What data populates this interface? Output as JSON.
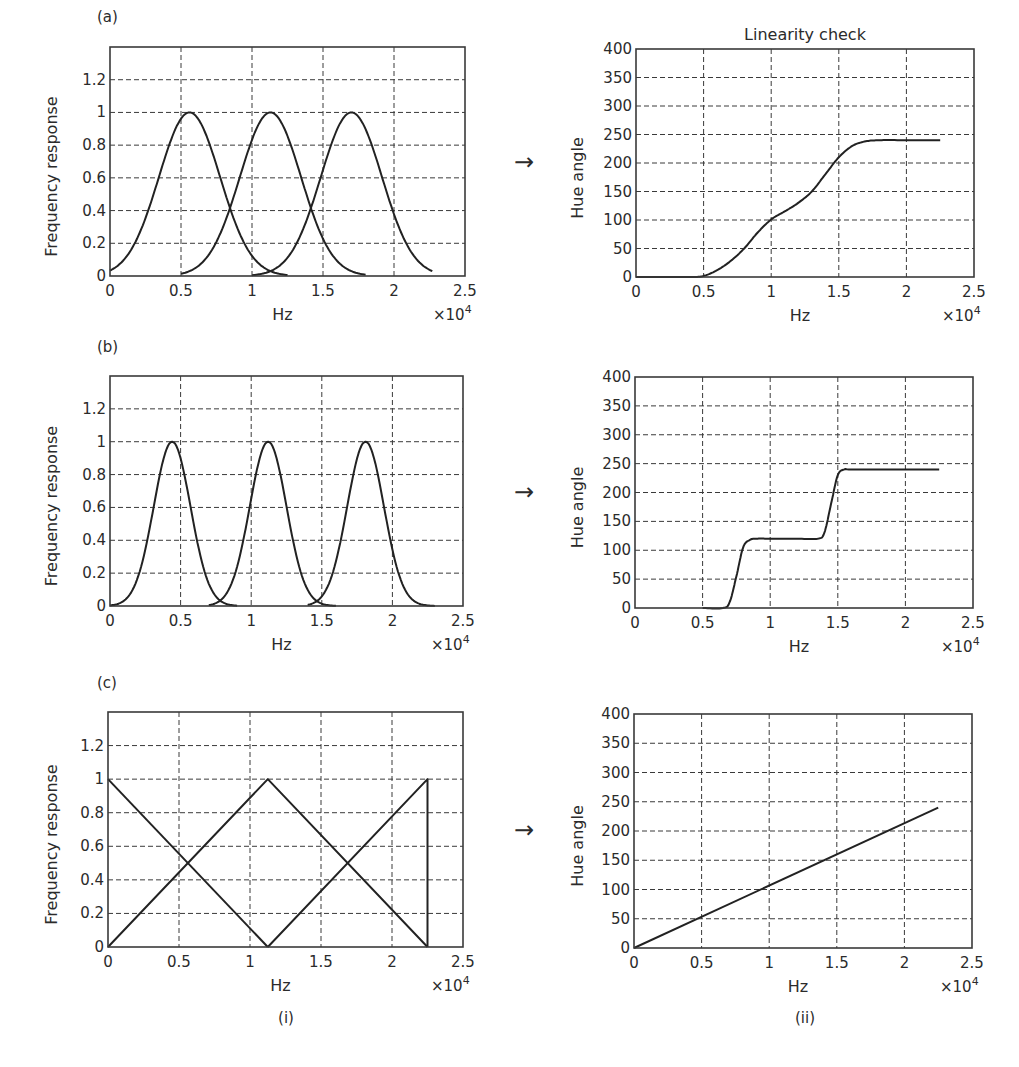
{
  "figure": {
    "panel_labels": [
      "(a)",
      "(b)",
      "(c)"
    ],
    "column_labels": [
      "(i)",
      "(ii)"
    ],
    "arrow_glyph": "→",
    "right_title": "Linearity check",
    "x_label": "Hz",
    "x_multiplier": "×10",
    "x_multiplier_exp": "4"
  },
  "chart_data": [
    {
      "id": "a-i",
      "type": "line",
      "title": "",
      "xlabel": "Hz",
      "xlabel_multiplier": "×10^4",
      "ylabel": "Frequency response",
      "xlim": [
        0,
        2.5
      ],
      "ylim": [
        0,
        1.4
      ],
      "xticks": [
        "0",
        "0.5",
        "1",
        "1.5",
        "2",
        "2.5"
      ],
      "yticks": [
        "0",
        "0.2",
        "0.4",
        "0.6",
        "0.8",
        "1",
        "1.2"
      ],
      "grid": true,
      "series": [
        {
          "name": "filter 1",
          "shape": "gaussian",
          "center": 0.56,
          "peak": 1,
          "x": [
            0,
            0.1,
            0.2,
            0.3,
            0.4,
            0.5,
            0.56,
            0.65,
            0.75,
            0.85,
            0.95,
            1.05,
            1.15,
            1.25
          ],
          "values": [
            0.04,
            0.13,
            0.29,
            0.52,
            0.77,
            0.96,
            1.0,
            0.93,
            0.72,
            0.45,
            0.22,
            0.08,
            0.02,
            0.0
          ]
        },
        {
          "name": "filter 2",
          "shape": "gaussian",
          "center": 1.13,
          "peak": 1,
          "x": [
            0.5,
            0.6,
            0.7,
            0.8,
            0.9,
            1.0,
            1.13,
            1.25,
            1.35,
            1.45,
            1.55,
            1.65,
            1.75,
            1.8
          ],
          "values": [
            0.0,
            0.03,
            0.11,
            0.28,
            0.55,
            0.83,
            1.0,
            0.88,
            0.65,
            0.39,
            0.18,
            0.06,
            0.01,
            0.0
          ]
        },
        {
          "name": "filter 3",
          "shape": "gaussian",
          "center": 1.7,
          "peak": 1,
          "x": [
            1.0,
            1.1,
            1.2,
            1.3,
            1.4,
            1.5,
            1.6,
            1.7,
            1.8,
            1.9,
            2.0,
            2.1,
            2.2,
            2.27
          ],
          "values": [
            0.0,
            0.01,
            0.06,
            0.18,
            0.39,
            0.65,
            0.9,
            1.0,
            0.91,
            0.68,
            0.41,
            0.2,
            0.08,
            0.05
          ]
        }
      ]
    },
    {
      "id": "a-ii",
      "type": "line",
      "title": "Linearity check",
      "xlabel": "Hz",
      "xlabel_multiplier": "×10^4",
      "ylabel": "Hue angle",
      "xlim": [
        0,
        2.5
      ],
      "ylim": [
        0,
        400
      ],
      "xticks": [
        "0",
        "0.5",
        "1",
        "1.5",
        "2",
        "2.5"
      ],
      "yticks": [
        "0",
        "50",
        "100",
        "150",
        "200",
        "250",
        "300",
        "350",
        "400"
      ],
      "grid": true,
      "series": [
        {
          "name": "hue",
          "x": [
            0,
            0.4,
            0.5,
            0.6,
            0.7,
            0.8,
            0.9,
            1.0,
            1.1,
            1.2,
            1.3,
            1.4,
            1.5,
            1.6,
            1.7,
            1.8,
            2.0,
            2.25
          ],
          "values": [
            0,
            0,
            2,
            12,
            28,
            50,
            78,
            101,
            115,
            130,
            150,
            180,
            210,
            230,
            238,
            240,
            240,
            240
          ]
        }
      ]
    },
    {
      "id": "b-i",
      "type": "line",
      "title": "",
      "xlabel": "Hz",
      "xlabel_multiplier": "×10^4",
      "ylabel": "Frequency response",
      "xlim": [
        0,
        2.5
      ],
      "ylim": [
        0,
        1.4
      ],
      "xticks": [
        "0",
        "0.5",
        "1",
        "1.5",
        "2",
        "2.5"
      ],
      "yticks": [
        "0",
        "0.2",
        "0.4",
        "0.6",
        "0.8",
        "1",
        "1.2"
      ],
      "grid": true,
      "series": [
        {
          "name": "filter 1",
          "shape": "gaussian",
          "center": 0.44,
          "peak": 1,
          "x": [
            0,
            0.1,
            0.2,
            0.3,
            0.4,
            0.44,
            0.5,
            0.6,
            0.7,
            0.8,
            0.9
          ],
          "values": [
            0.0,
            0.06,
            0.25,
            0.62,
            0.96,
            1.0,
            0.94,
            0.6,
            0.22,
            0.05,
            0.0
          ]
        },
        {
          "name": "filter 2",
          "shape": "gaussian",
          "center": 1.12,
          "peak": 1,
          "x": [
            0.7,
            0.8,
            0.9,
            1.0,
            1.1,
            1.12,
            1.2,
            1.3,
            1.4,
            1.5,
            1.6
          ],
          "values": [
            0.0,
            0.06,
            0.28,
            0.68,
            0.98,
            1.0,
            0.88,
            0.5,
            0.17,
            0.03,
            0.0
          ]
        },
        {
          "name": "filter 3",
          "shape": "gaussian",
          "center": 1.81,
          "peak": 1,
          "x": [
            1.4,
            1.5,
            1.6,
            1.7,
            1.8,
            1.81,
            1.9,
            2.0,
            2.1,
            2.2,
            2.3
          ],
          "values": [
            0.0,
            0.07,
            0.3,
            0.7,
            1.0,
            1.0,
            0.87,
            0.46,
            0.15,
            0.03,
            0.0
          ]
        }
      ]
    },
    {
      "id": "b-ii",
      "type": "line",
      "title": "",
      "xlabel": "Hz",
      "xlabel_multiplier": "×10^4",
      "ylabel": "Hue angle",
      "xlim": [
        0,
        2.5
      ],
      "ylim": [
        0,
        400
      ],
      "xticks": [
        "0",
        "0.5",
        "1",
        "1.5",
        "2",
        "2.5"
      ],
      "yticks": [
        "0",
        "50",
        "100",
        "150",
        "200",
        "250",
        "300",
        "350",
        "400"
      ],
      "grid": true,
      "series": [
        {
          "name": "hue",
          "x": [
            0.5,
            0.65,
            0.7,
            0.75,
            0.8,
            0.85,
            0.9,
            1.0,
            1.2,
            1.35,
            1.4,
            1.45,
            1.5,
            1.55,
            1.6,
            2.0,
            2.25
          ],
          "values": [
            0,
            0,
            10,
            55,
            105,
            118,
            120,
            120,
            120,
            120,
            130,
            180,
            230,
            240,
            240,
            240,
            240
          ]
        }
      ]
    },
    {
      "id": "c-i",
      "type": "line",
      "title": "",
      "xlabel": "Hz",
      "xlabel_multiplier": "×10^4",
      "ylabel": "Frequency response",
      "xlim": [
        0,
        2.5
      ],
      "ylim": [
        0,
        1.4
      ],
      "xticks": [
        "0",
        "0.5",
        "1",
        "1.5",
        "2",
        "2.5"
      ],
      "yticks": [
        "0",
        "0.2",
        "0.4",
        "0.6",
        "0.8",
        "1",
        "1.2"
      ],
      "grid": true,
      "series": [
        {
          "name": "filter 1 (falling)",
          "x": [
            0,
            1.125
          ],
          "values": [
            1,
            0
          ]
        },
        {
          "name": "filter 2 (triangle)",
          "x": [
            0,
            1.125,
            2.25
          ],
          "values": [
            0,
            1,
            0
          ]
        },
        {
          "name": "filter 3 (rising)",
          "x": [
            1.125,
            2.25,
            2.25
          ],
          "values": [
            0,
            1,
            0
          ]
        }
      ]
    },
    {
      "id": "c-ii",
      "type": "line",
      "title": "",
      "xlabel": "Hz",
      "xlabel_multiplier": "×10^4",
      "ylabel": "Hue angle",
      "xlim": [
        0,
        2.5
      ],
      "ylim": [
        0,
        400
      ],
      "xticks": [
        "0",
        "0.5",
        "1",
        "1.5",
        "2",
        "2.5"
      ],
      "yticks": [
        "0",
        "50",
        "100",
        "150",
        "200",
        "250",
        "300",
        "350",
        "400"
      ],
      "grid": true,
      "series": [
        {
          "name": "hue",
          "x": [
            0,
            2.25
          ],
          "values": [
            0,
            240
          ]
        }
      ]
    }
  ]
}
